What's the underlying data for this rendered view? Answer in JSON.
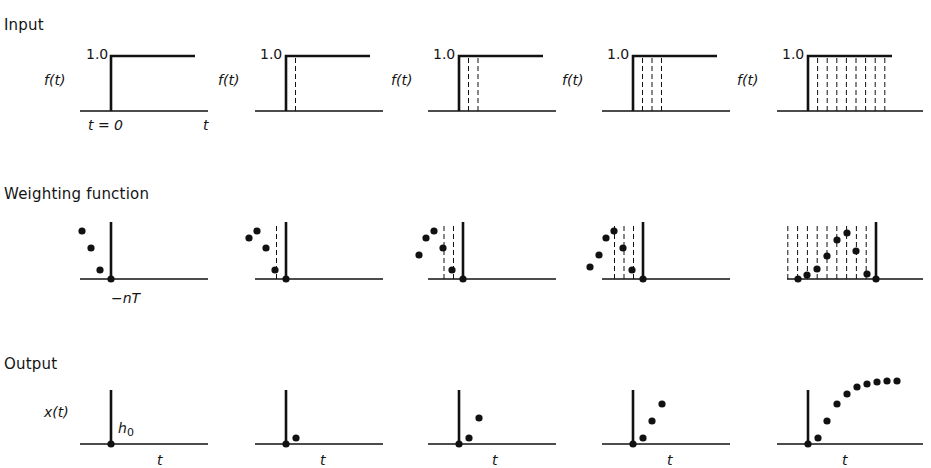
{
  "rows": [
    {
      "key": "input",
      "title": "Input",
      "y_label": "f(t)",
      "level_label": "1.0",
      "origin_label": "t = 0",
      "axis_label": "t"
    },
    {
      "key": "weighting",
      "title": "Weighting function",
      "shift_label": "−nT"
    },
    {
      "key": "output",
      "title": "Output",
      "y_label": "x(t)",
      "h_label": "h",
      "h_subscript": "0",
      "axis_label": "t"
    }
  ],
  "colors": {
    "ink": "#111111",
    "paper": "#ffffff"
  },
  "panels": {
    "x_offsets": [
      0,
      175,
      348,
      522,
      697
    ],
    "axis_start": 80,
    "axis_end": 208,
    "step_x": 111,
    "sample_spacing": 14.5,
    "input": {
      "axis_y": 111,
      "top_y": 56,
      "top_end": 195,
      "dashed_counts": [
        0,
        1,
        2,
        3,
        8
      ]
    },
    "weighting": {
      "axis_y": 279,
      "bar_top": 222,
      "dashed_counts": [
        0,
        1,
        2,
        3,
        9
      ],
      "dots": [
        [
          [
            -29,
            231
          ],
          [
            -20,
            248
          ],
          [
            -11,
            270
          ],
          [
            0,
            279
          ]
        ],
        [
          [
            -37,
            238
          ],
          [
            -29,
            231
          ],
          [
            -20,
            248
          ],
          [
            -11,
            270
          ],
          [
            0,
            279
          ]
        ],
        [
          [
            -44,
            255
          ],
          [
            -37,
            238
          ],
          [
            -29,
            231
          ],
          [
            -20,
            248
          ],
          [
            -11,
            270
          ],
          [
            0,
            279
          ]
        ],
        [
          [
            -53,
            267
          ],
          [
            -44,
            255
          ],
          [
            -37,
            238
          ],
          [
            -29,
            231
          ],
          [
            -20,
            248
          ],
          [
            -11,
            270
          ],
          [
            0,
            279
          ]
        ],
        [
          [
            -78,
            279
          ],
          [
            -69,
            275
          ],
          [
            -59,
            269
          ],
          [
            -49,
            256
          ],
          [
            -39,
            240
          ],
          [
            -29,
            233
          ],
          [
            -20,
            251
          ],
          [
            -9,
            274
          ],
          [
            0,
            279
          ]
        ]
      ]
    },
    "output": {
      "axis_y": 444,
      "bar_top": 390,
      "dots": [
        [
          [
            0,
            444
          ]
        ],
        [
          [
            0,
            444
          ],
          [
            10,
            438
          ]
        ],
        [
          [
            0,
            444
          ],
          [
            10,
            438
          ],
          [
            20,
            418
          ]
        ],
        [
          [
            0,
            444
          ],
          [
            10,
            438
          ],
          [
            19,
            421
          ],
          [
            29,
            404
          ]
        ],
        [
          [
            0,
            444
          ],
          [
            10,
            438
          ],
          [
            19,
            421
          ],
          [
            29,
            404
          ],
          [
            39,
            394
          ],
          [
            49,
            387
          ],
          [
            59,
            384
          ],
          [
            69,
            382
          ],
          [
            79,
            381
          ],
          [
            89,
            381
          ]
        ]
      ]
    }
  },
  "chart_data": {
    "type": "scatter",
    "rows": [
      "Input",
      "Weighting function",
      "Output"
    ],
    "input": {
      "ylabel": "f(t)",
      "level": 1.0,
      "xlabel": "t",
      "origin": "t=0",
      "panels": 5
    },
    "weighting_function": {
      "shift_label": "-nT",
      "samples_per_panel": [
        4,
        5,
        6,
        7,
        9
      ]
    },
    "output": {
      "ylabel": "x(t)",
      "first_sample": "h0",
      "samples_per_panel": [
        1,
        2,
        3,
        4,
        10
      ],
      "final_values_relative": [
        0,
        0.1,
        0.38,
        0.63,
        0.79,
        0.91,
        0.96,
        0.99,
        1.0,
        1.0
      ]
    }
  }
}
